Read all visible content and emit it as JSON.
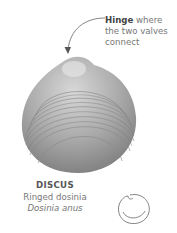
{
  "callout": {
    "term": "Hinge",
    "rest_line1": " where",
    "line2": "the two valves",
    "line3": "connect"
  },
  "specimen": {
    "family": "DISCUS",
    "common_name": "Ringed dosinia",
    "latin_name": "Dosinia anus"
  },
  "icons": {
    "shell_image": "clam-shell-illustration",
    "shell_outline": "shell-outline-icon"
  }
}
